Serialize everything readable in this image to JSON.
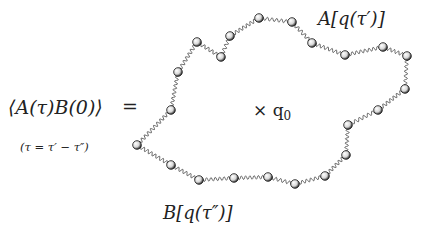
{
  "diagram": {
    "correlator_lhs": "⟨A(τ)B(0)⟩",
    "equals": "=",
    "tau_definition": "(τ = τ′ − τ″)",
    "center_label": "× q",
    "center_subscript": "0",
    "label_A": "A[q(τ′)]",
    "label_B": "B[q(τ″)]",
    "colors": {
      "spring": "#555555",
      "bead_fill": "#f4f4f4",
      "bead_stroke": "#111111",
      "text": "#222222"
    },
    "beads": [
      [
        137,
        145
      ],
      [
        171,
        110
      ],
      [
        178,
        72
      ],
      [
        197,
        42
      ],
      [
        221,
        57
      ],
      [
        230,
        36
      ],
      [
        259,
        18
      ],
      [
        292,
        22
      ],
      [
        312,
        43
      ],
      [
        345,
        55
      ],
      [
        383,
        47
      ],
      [
        407,
        56
      ],
      [
        405,
        89
      ],
      [
        378,
        110
      ],
      [
        348,
        125
      ],
      [
        346,
        155
      ],
      [
        325,
        176
      ],
      [
        295,
        184
      ],
      [
        268,
        177
      ],
      [
        234,
        178
      ],
      [
        199,
        180
      ],
      [
        171,
        165
      ]
    ]
  }
}
